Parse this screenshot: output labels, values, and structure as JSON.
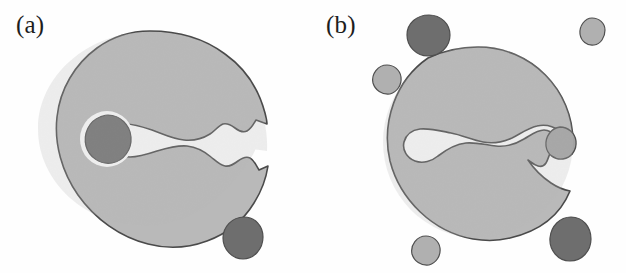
{
  "figure": {
    "background_color": "#fefefe",
    "panel_count": 2,
    "caption_style": "parenthetical-letter"
  },
  "palette": {
    "background": "#fefefe",
    "body_light_gray": "#b9b9b9",
    "body_light_gray_shade": "#b0b0b0",
    "inclusion_dark_gray": "#6e6e6e",
    "outline": "#4a4a4a",
    "void_white": "#ffffff",
    "label_text": "#1d1d1d"
  },
  "panels": [
    {
      "id": "a",
      "label": "(a)",
      "description": "Large crescent / C-shaped light-gray body opening to the right, with a wavy indented mouth, one dark-gray circular inclusion inside a white halo on the left of the opening, and one detached dark-gray blob outside at lower right.",
      "main_shape": {
        "name": "crescent-body",
        "fill": "#b9b9b9",
        "stroke": "#4a4a4a",
        "opening_direction": "right"
      },
      "inclusions": [
        {
          "name": "dark-inclusion-circle",
          "fill": "#6e6e6e",
          "halo": "#ffffff",
          "position": "mouth-left",
          "cx": 107,
          "cy": 139,
          "rx": 23,
          "ry": 24
        }
      ],
      "satellites": [
        {
          "name": "dark-satellite-lower-right",
          "fill": "#6e6e6e",
          "cx": 243,
          "cy": 238,
          "rx": 20,
          "ry": 21
        }
      ]
    },
    {
      "id": "b",
      "label": "(b)",
      "description": "Large near-circular light-gray body with a narrow wavy white slit cutting horizontally through its middle; a small medium-gray blob sits at the right end of the slit. Five detached blobs surround the body: dark-gray at top-left and bottom-right, light-gray at top-right, mid-left and bottom-left.",
      "main_shape": {
        "name": "round-body",
        "fill": "#b9b9b9",
        "stroke": "#4a4a4a",
        "opening_direction": "internal-slit"
      },
      "inclusions": [
        {
          "name": "slit-end-blob",
          "fill": "#a2a2a2",
          "position": "slit-right-end",
          "cx": 562,
          "cy": 142,
          "rx": 16,
          "ry": 17
        }
      ],
      "satellites": [
        {
          "name": "dark-satellite-top-left",
          "fill": "#6e6e6e",
          "cx": 428,
          "cy": 35,
          "rx": 21,
          "ry": 20
        },
        {
          "name": "light-satellite-top-right",
          "fill": "#b0b0b0",
          "cx": 592,
          "cy": 31,
          "rx": 13,
          "ry": 14
        },
        {
          "name": "light-satellite-mid-left",
          "fill": "#b0b0b0",
          "cx": 386,
          "cy": 79,
          "rx": 14,
          "ry": 15
        },
        {
          "name": "light-satellite-bottom-left",
          "fill": "#b0b0b0",
          "cx": 424,
          "cy": 250,
          "rx": 14,
          "ry": 15
        },
        {
          "name": "dark-satellite-bottom-right",
          "fill": "#6e6e6e",
          "cx": 570,
          "cy": 238,
          "rx": 20,
          "ry": 22
        }
      ]
    }
  ]
}
